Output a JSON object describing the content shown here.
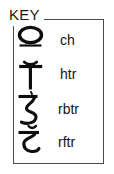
{
  "legend": {
    "title": "KEY",
    "box_border_color": "#4a4a4a",
    "text_color": "#141414",
    "entries": [
      {
        "symbol_name": "devanagari-oval-glyph",
        "label": "ch"
      },
      {
        "symbol_name": "devanagari-t-bar-glyph",
        "label": "htr"
      },
      {
        "symbol_name": "devanagari-ezh-hook-glyph",
        "label": "rbtr"
      },
      {
        "symbol_name": "devanagari-curved-hook-glyph",
        "label": "rftr"
      }
    ]
  }
}
